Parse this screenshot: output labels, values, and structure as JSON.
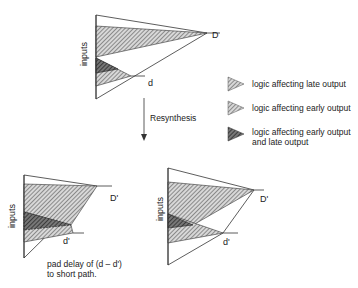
{
  "top_diagram": {
    "axis_label": "inputs",
    "late_label": "D",
    "early_label": "d"
  },
  "arrow": {
    "label": "Resynthesis"
  },
  "legend": {
    "items": [
      {
        "icon": "late-hatch-triangle",
        "label": "logic affecting late output"
      },
      {
        "icon": "early-hatch-triangle",
        "label": "logic affecting early output"
      },
      {
        "icon": "shared-dark-triangle",
        "label_line1": "logic affecting early output",
        "label_line2": "and late output"
      }
    ]
  },
  "bottom_left_diagram": {
    "axis_label": "inputs",
    "late_label": "D'",
    "early_label": "d'",
    "caption_line1": "pad delay of (d – d')",
    "caption_line2": "to short path."
  },
  "bottom_right_diagram": {
    "axis_label": "inputs",
    "late_label": "D'",
    "early_label": "d'"
  }
}
